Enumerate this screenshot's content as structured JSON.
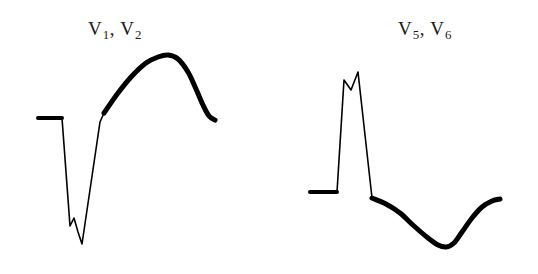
{
  "figure": {
    "title": "",
    "background_color": "#ffffff",
    "trace_color": "#000000",
    "width": 538,
    "height": 274
  },
  "chart_data": {
    "type": "line",
    "title": "",
    "subtitle": "",
    "xlabel": "",
    "ylabel": "",
    "grid": false,
    "legend_position": "none",
    "axis_visible": false,
    "panels": [
      {
        "id": "panel-left",
        "label": "V1, V2",
        "label_base": "V",
        "label_subscripts": [
          "1",
          "2"
        ],
        "label_position": {
          "x": 88,
          "y": 18
        },
        "baseline_y": 118,
        "morphology": "rS with deep S wave, fragmented notch, and tall broad upright T wave",
        "series": [
          {
            "name": "isoelectric-baseline",
            "stroke_width": 4.0,
            "points": [
              [
                38,
                118
              ],
              [
                62,
                118
              ]
            ]
          },
          {
            "name": "qrs-complex",
            "stroke_width": 1.6,
            "points": [
              [
                62,
                118
              ],
              [
                70,
                226
              ],
              [
                74,
                218
              ],
              [
                78,
                232
              ],
              [
                82,
                244
              ],
              [
                100,
                122
              ],
              [
                104,
                113
              ]
            ]
          },
          {
            "name": "t-wave",
            "stroke_width": 5.0,
            "points": [
              [
                104,
                113
              ],
              [
                118,
                93
              ],
              [
                132,
                76
              ],
              [
                146,
                63
              ],
              [
                158,
                57
              ],
              [
                168,
                55
              ],
              [
                178,
                59
              ],
              [
                188,
                72
              ],
              [
                196,
                89
              ],
              [
                203,
                105
              ],
              [
                209,
                116
              ],
              [
                215,
                120
              ]
            ]
          }
        ]
      },
      {
        "id": "panel-right",
        "label": "V5, V6",
        "label_base": "V",
        "label_subscripts": [
          "5",
          "6"
        ],
        "label_position": {
          "x": 398,
          "y": 18
        },
        "baseline_y": 192,
        "morphology": "tall notched RR-prime complex with ST depression and deep inverted T wave",
        "series": [
          {
            "name": "isoelectric-baseline",
            "stroke_width": 4.0,
            "points": [
              [
                310,
                192
              ],
              [
                337,
                192
              ]
            ]
          },
          {
            "name": "qrs-complex",
            "stroke_width": 1.6,
            "points": [
              [
                337,
                192
              ],
              [
                344,
                80
              ],
              [
                351,
                90
              ],
              [
                358,
                72
              ],
              [
                372,
                198
              ]
            ]
          },
          {
            "name": "t-wave",
            "stroke_width": 5.0,
            "points": [
              [
                372,
                198
              ],
              [
                386,
                204
              ],
              [
                400,
                213
              ],
              [
                414,
                226
              ],
              [
                428,
                238
              ],
              [
                438,
                245
              ],
              [
                446,
                247
              ],
              [
                454,
                243
              ],
              [
                462,
                232
              ],
              [
                472,
                218
              ],
              [
                482,
                207
              ],
              [
                492,
                201
              ],
              [
                500,
                199
              ]
            ]
          }
        ]
      }
    ]
  }
}
